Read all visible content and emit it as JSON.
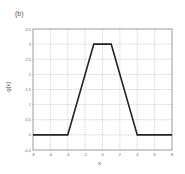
{
  "panel": {
    "label": "(b)"
  },
  "chart_data": {
    "type": "line",
    "title": "",
    "xlabel": "x",
    "ylabel": "g[x]",
    "xlim": [
      -8,
      8
    ],
    "ylim": [
      -0.5,
      3.5
    ],
    "grid": true,
    "x_ticks": [
      -8,
      -6,
      -4,
      -2,
      0,
      2,
      4,
      6,
      8
    ],
    "y_ticks": [
      -0.5,
      0,
      0.5,
      1,
      1.5,
      2,
      2.5,
      3,
      3.5
    ],
    "x_tick_labels": [
      "-8",
      "-6",
      "-4",
      "-2",
      "0",
      "2",
      "4",
      "6",
      "8"
    ],
    "y_tick_labels": [
      "-0.5",
      "0",
      "0.5",
      "1",
      "1.5",
      "2",
      "2.5",
      "3",
      "3.5"
    ],
    "series": [
      {
        "name": "g[x]",
        "color": "#222222",
        "x": [
          -8,
          -4,
          -1,
          1,
          4,
          8
        ],
        "y": [
          0,
          0,
          3,
          3,
          0,
          0
        ]
      }
    ]
  }
}
